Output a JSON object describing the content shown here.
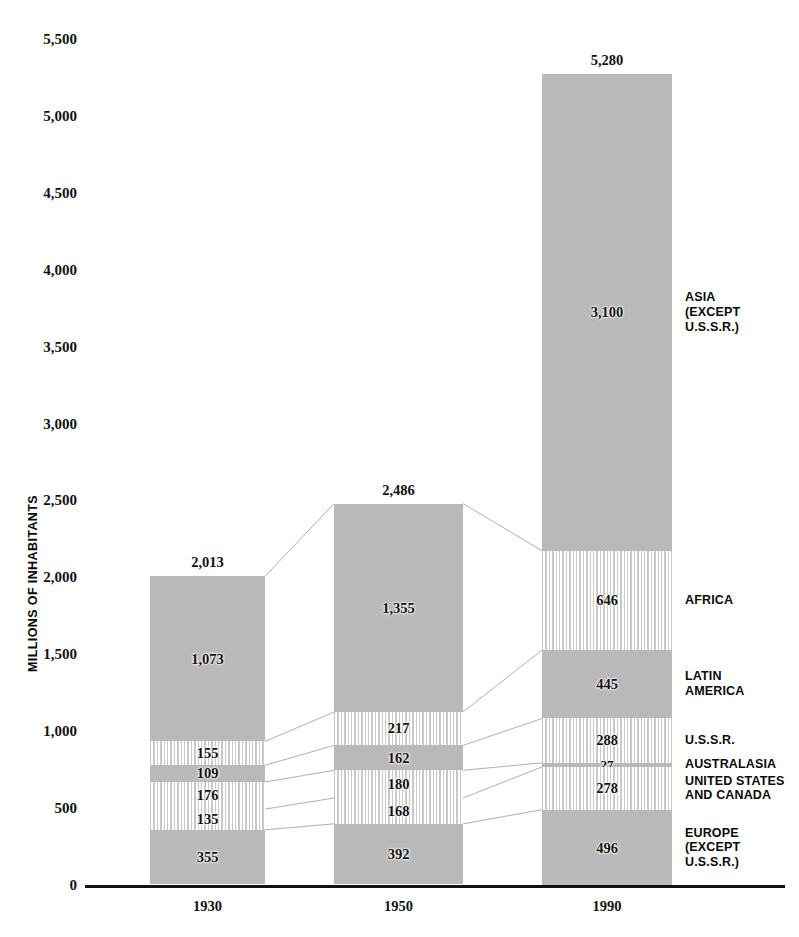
{
  "chart_data": {
    "type": "bar",
    "subtype": "stacked-bar",
    "title": "",
    "xlabel": "",
    "ylabel": "MILLIONS OF INHABITANTS",
    "categories": [
      "1930",
      "1950",
      "1990"
    ],
    "ylim": [
      0,
      5500
    ],
    "y_ticks": [
      0,
      500,
      1000,
      1500,
      2000,
      2500,
      3000,
      3500,
      4000,
      4500,
      5000,
      5500
    ],
    "y_tick_labels": [
      "0",
      "500",
      "1,000",
      "1,500",
      "2,000",
      "2,500",
      "3,000",
      "3,500",
      "4,000",
      "4,500",
      "5,000",
      "5,500"
    ],
    "grid": false,
    "legend_position": "right",
    "totals": [
      2013,
      2486,
      5280
    ],
    "total_labels": [
      "2,013",
      "2,486",
      "5,280"
    ],
    "series": [
      {
        "name": "ASIA (EXCEPT U.S.S.R.)",
        "fill": "solid",
        "values": [
          1073,
          1355,
          3100
        ],
        "labels": [
          "1,073",
          "1,355",
          "3,100"
        ]
      },
      {
        "name": "AFRICA",
        "fill": "hatched",
        "values": [
          155,
          217,
          646
        ],
        "labels": [
          "155",
          "217",
          "646"
        ]
      },
      {
        "name": "LATIN AMERICA",
        "fill": "solid",
        "values": [
          109,
          162,
          445
        ],
        "labels": [
          "109",
          "162",
          "445"
        ]
      },
      {
        "name": "U.S.S.R.",
        "fill": "hatched",
        "values": [
          176,
          180,
          288
        ],
        "labels": [
          "176",
          "180",
          "288"
        ]
      },
      {
        "name": "AUSTRALASIA",
        "fill": "solid",
        "values": [
          0,
          0,
          27
        ],
        "labels": [
          "",
          "",
          "27"
        ]
      },
      {
        "name": "UNITED STATES AND CANADA",
        "fill": "hatched",
        "values": [
          135,
          168,
          278
        ],
        "labels": [
          "135",
          "168",
          "278"
        ]
      },
      {
        "name": "EUROPE (EXCEPT U.S.S.R.)",
        "fill": "solid",
        "values": [
          355,
          392,
          496
        ],
        "labels": [
          "355",
          "392",
          "496"
        ]
      }
    ]
  },
  "axis": {
    "y_title": "MILLIONS OF INHABITANTS",
    "y_labels": [
      "5,500",
      "5,000",
      "4,500",
      "4,000",
      "3,500",
      "3,000",
      "2,500",
      "2,000",
      "1,500",
      "1,000",
      "500",
      "0"
    ],
    "x_labels": [
      "1930",
      "1950",
      "1990"
    ]
  },
  "bars": [
    {
      "year": "1930",
      "total_label": "2,013",
      "segments": [
        {
          "label": "1,073",
          "fill": "solid"
        },
        {
          "label": "155",
          "fill": "hatched"
        },
        {
          "label": "109",
          "fill": "solid"
        },
        {
          "label": "176",
          "fill": "hatched"
        },
        {
          "label": "135",
          "fill": "hatched"
        },
        {
          "label": "355",
          "fill": "solid"
        }
      ]
    },
    {
      "year": "1950",
      "total_label": "2,486",
      "segments": [
        {
          "label": "1,355",
          "fill": "solid"
        },
        {
          "label": "217",
          "fill": "hatched"
        },
        {
          "label": "162",
          "fill": "solid"
        },
        {
          "label": "180",
          "fill": "hatched"
        },
        {
          "label": "168",
          "fill": "hatched"
        },
        {
          "label": "392",
          "fill": "solid"
        }
      ]
    },
    {
      "year": "1990",
      "total_label": "5,280",
      "segments": [
        {
          "label": "3,100",
          "fill": "solid"
        },
        {
          "label": "646",
          "fill": "hatched"
        },
        {
          "label": "445",
          "fill": "solid"
        },
        {
          "label": "288",
          "fill": "hatched"
        },
        {
          "label": "27",
          "fill": "solid"
        },
        {
          "label": "278",
          "fill": "hatched"
        },
        {
          "label": "496",
          "fill": "solid"
        }
      ]
    }
  ],
  "legend": [
    {
      "text": "ASIA\n(EXCEPT\nU.S.S.R.)"
    },
    {
      "text": "AFRICA"
    },
    {
      "text": "LATIN\nAMERICA"
    },
    {
      "text": "U.S.S.R."
    },
    {
      "text": "AUSTRALASIA"
    },
    {
      "text": "UNITED STATES\nAND CANADA"
    },
    {
      "text": "EUROPE\n(EXCEPT\nU.S.S.R.)"
    }
  ],
  "colors": {
    "solid_fill": "#b9b9b9",
    "hatch_line": "#c9c9c9",
    "text": "#111111",
    "axis": "#111111",
    "connector": "#b0b0b0"
  }
}
